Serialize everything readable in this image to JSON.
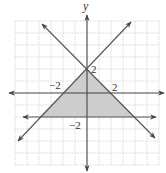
{
  "figure": {
    "type": "coordinate-plane-inequality-graph",
    "axis_labels": {
      "y": "y"
    },
    "tick_labels": {
      "y_pos": "2",
      "x_pos": "2",
      "x_neg": "−2",
      "y_neg": "−2"
    },
    "grid": {
      "xmin": -6,
      "xmax": 6,
      "ymin": -6,
      "ymax": 6,
      "step": 1
    },
    "lines": [
      {
        "name": "y = x + 2",
        "slope": 1,
        "intercept": 2,
        "style": "solid",
        "arrows": "both"
      },
      {
        "name": "y = -x + 2",
        "slope": -1,
        "intercept": 2,
        "style": "solid",
        "arrows": "both"
      },
      {
        "name": "y = -2",
        "slope": 0,
        "intercept": -2,
        "style": "solid",
        "arrows": "both"
      }
    ],
    "shaded_region": {
      "vertices": [
        [
          0,
          2
        ],
        [
          -4,
          -2
        ],
        [
          4,
          -2
        ]
      ],
      "fill": "#c8c8c8"
    },
    "colors": {
      "grid": "#cfcfcf",
      "axis": "#444444",
      "line": "#555555",
      "shade": "#c8c8c8"
    }
  }
}
